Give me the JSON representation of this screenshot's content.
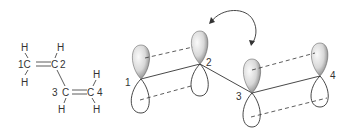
{
  "structure": {
    "atoms": [
      {
        "id": "H1a",
        "label": "H"
      },
      {
        "id": "C1",
        "label": "1C"
      },
      {
        "id": "H1b",
        "label": "H"
      },
      {
        "id": "C2",
        "label": "C"
      },
      {
        "id": "C2num",
        "label": "2"
      },
      {
        "id": "H2",
        "label": "H"
      },
      {
        "id": "C3num",
        "label": "3"
      },
      {
        "id": "C3",
        "label": "C"
      },
      {
        "id": "H3",
        "label": "H"
      },
      {
        "id": "C4",
        "label": "C"
      },
      {
        "id": "C4num",
        "label": "4"
      },
      {
        "id": "H4a",
        "label": "H"
      },
      {
        "id": "H4b",
        "label": "H"
      }
    ]
  },
  "orbitals": {
    "labels": [
      "1",
      "2",
      "3",
      "4"
    ]
  },
  "colors": {
    "line": "#333333",
    "lobe_fill_light": "#f2f2f2",
    "lobe_fill_dark": "#8a8a8a"
  }
}
